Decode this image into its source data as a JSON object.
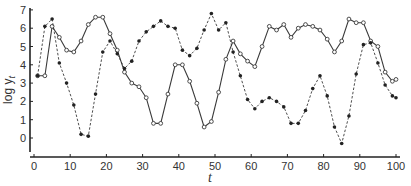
{
  "chart_data": {
    "type": "line",
    "title": "",
    "xlabel": "t",
    "ylabel": "log y_t",
    "xlim": [
      0,
      100
    ],
    "ylim": [
      -0.5,
      7
    ],
    "x_ticks": [
      0,
      10,
      20,
      30,
      40,
      50,
      60,
      70,
      80,
      90,
      100
    ],
    "y_ticks": [
      0,
      1,
      2,
      3,
      4,
      5,
      6,
      7
    ],
    "grid": false,
    "legend": null,
    "series": [
      {
        "name": "open circles (solid line)",
        "line_style": "solid",
        "marker": "open-circle",
        "x": [
          1,
          3,
          5,
          7,
          9,
          11,
          13,
          15,
          17,
          19,
          21,
          23,
          25,
          27,
          29,
          31,
          33,
          35,
          37,
          39,
          41,
          43,
          45,
          47,
          49,
          51,
          53,
          55,
          57,
          59,
          61,
          63,
          65,
          67,
          69,
          71,
          73,
          75,
          77,
          79,
          81,
          83,
          85,
          87,
          89,
          91,
          93,
          95,
          97,
          99,
          100
        ],
        "y": [
          3.4,
          3.4,
          6.1,
          5.5,
          4.8,
          4.7,
          5.3,
          6.2,
          6.6,
          6.6,
          5.7,
          4.8,
          3.6,
          3.0,
          2.8,
          2.2,
          0.8,
          0.8,
          2.4,
          4.0,
          4.0,
          3.1,
          1.9,
          0.6,
          0.9,
          2.5,
          4.3,
          5.3,
          4.6,
          4.2,
          3.9,
          5.0,
          6.1,
          5.9,
          6.2,
          5.5,
          6.0,
          6.2,
          6.1,
          5.9,
          5.4,
          4.7,
          5.3,
          6.5,
          6.3,
          6.3,
          5.3,
          5.0,
          3.6,
          3.1,
          3.2
        ]
      },
      {
        "name": "filled dots (dashed line)",
        "line_style": "dashed",
        "marker": "filled-dot",
        "x": [
          1,
          3,
          5,
          7,
          9,
          11,
          13,
          15,
          17,
          19,
          21,
          23,
          25,
          27,
          29,
          31,
          33,
          35,
          37,
          39,
          41,
          43,
          45,
          47,
          49,
          51,
          53,
          55,
          57,
          59,
          61,
          63,
          65,
          67,
          69,
          71,
          73,
          75,
          77,
          79,
          81,
          83,
          85,
          87,
          89,
          91,
          93,
          95,
          97,
          99,
          100
        ],
        "y": [
          3.4,
          6.1,
          6.5,
          4.1,
          3.0,
          1.8,
          0.2,
          0.1,
          2.4,
          4.7,
          5.3,
          4.6,
          3.8,
          4.2,
          5.3,
          5.8,
          6.1,
          6.4,
          6.1,
          6.0,
          4.8,
          4.5,
          4.9,
          5.9,
          6.8,
          5.9,
          6.3,
          4.7,
          3.4,
          2.1,
          1.6,
          2.0,
          2.2,
          2.0,
          1.7,
          0.8,
          0.8,
          1.5,
          2.7,
          3.4,
          2.3,
          0.6,
          -0.3,
          1.2,
          3.5,
          5.1,
          5.2,
          4.1,
          2.9,
          2.3,
          2.2
        ]
      }
    ]
  },
  "axes": {
    "xlabel": "t",
    "ylabel_main": "log y",
    "ylabel_sub": "t"
  },
  "style": {
    "line_color": "#3a3a3a",
    "axis_color": "#222222",
    "background": "#ffffff"
  }
}
